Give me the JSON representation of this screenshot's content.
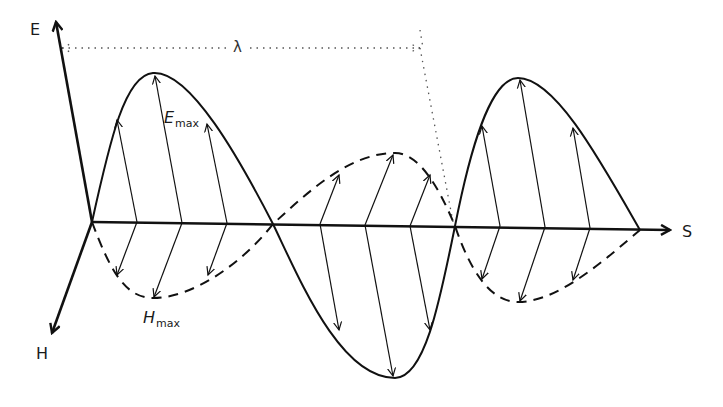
{
  "diagram": {
    "type": "electromagnetic-wave",
    "axes": {
      "e_axis_label": "E",
      "h_axis_label": "H",
      "s_axis_label": "S"
    },
    "labels": {
      "e_max_main": "E",
      "e_max_sub": "max",
      "h_max_main": "H",
      "h_max_sub": "max",
      "wavelength": "λ"
    },
    "waves": {
      "electric": {
        "style": "solid",
        "color": "#111111",
        "half_periods": 3
      },
      "magnetic": {
        "style": "dashed",
        "color": "#111111",
        "half_periods": 3
      }
    },
    "colors": {
      "line": "#111111",
      "dotted": "#555555",
      "background": "#ffffff"
    }
  }
}
